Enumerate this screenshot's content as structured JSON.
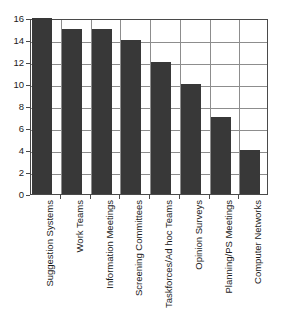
{
  "chart_data": {
    "type": "bar",
    "title": "",
    "subtitle": "",
    "xlabel": "",
    "ylabel": "",
    "ylim": [
      0,
      16
    ],
    "ytick_step": 2,
    "yticks": [
      0,
      2,
      4,
      6,
      8,
      10,
      12,
      14,
      16
    ],
    "grid": "horizontal-and-vertical",
    "legend": "none",
    "bar_color": "#383838",
    "frame_color": "#4a4a4a",
    "grid_color": "#8d8d8d",
    "categories": [
      "Suggestion Systems",
      "Work Teams",
      "Information Meetings",
      "Screening Committees",
      "Taskforces/Ad hoc Teams",
      "Opinion Surveys",
      "Planning/PS Meetings",
      "Computer Networks"
    ],
    "values": [
      16,
      15,
      15,
      14,
      12,
      10,
      7,
      4
    ]
  }
}
